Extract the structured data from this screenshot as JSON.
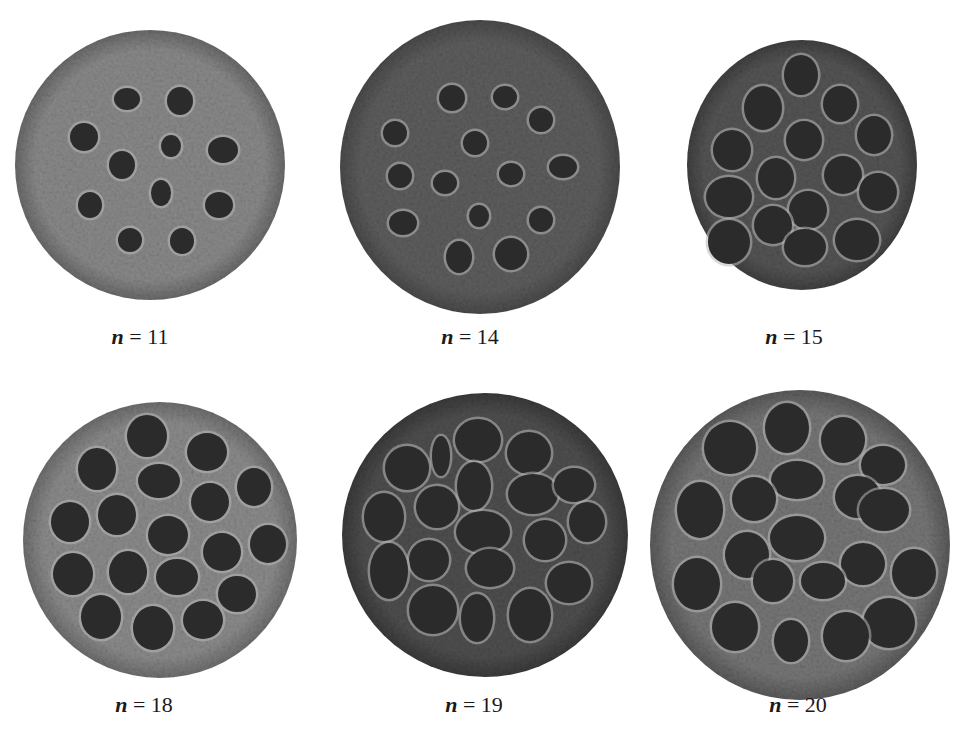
{
  "figure": {
    "panels": [
      {
        "id": "n11",
        "caption_var": "n",
        "caption_eq": " = ",
        "caption_value": "11",
        "pod": {
          "cx": 150,
          "cy": 165,
          "rx": 135,
          "ry": 135,
          "tone": "#8a8a8a",
          "rim": "#6a6a6a"
        },
        "holes": [
          [
            127,
            99,
            13,
            11
          ],
          [
            180,
            101,
            13,
            14
          ],
          [
            84,
            137,
            14,
            14
          ],
          [
            171,
            146,
            10,
            11
          ],
          [
            223,
            150,
            15,
            13
          ],
          [
            122,
            165,
            13,
            14
          ],
          [
            161,
            193,
            10,
            13
          ],
          [
            219,
            205,
            14,
            13
          ],
          [
            90,
            205,
            12,
            13
          ],
          [
            130,
            240,
            12,
            12
          ],
          [
            182,
            241,
            12,
            13
          ]
        ]
      },
      {
        "id": "n14",
        "caption_var": "n",
        "caption_eq": " = ",
        "caption_value": "14",
        "pod": {
          "cx": 480,
          "cy": 167,
          "rx": 140,
          "ry": 147,
          "tone": "#5e5e5e",
          "rim": "#4a4a4a"
        },
        "holes": [
          [
            452,
            98,
            13,
            13
          ],
          [
            505,
            97,
            12,
            11
          ],
          [
            541,
            120,
            12,
            12
          ],
          [
            395,
            133,
            12,
            12
          ],
          [
            475,
            143,
            12,
            12
          ],
          [
            400,
            176,
            12,
            12
          ],
          [
            445,
            183,
            12,
            11
          ],
          [
            511,
            174,
            12,
            11
          ],
          [
            563,
            167,
            14,
            11
          ],
          [
            403,
            223,
            14,
            12
          ],
          [
            479,
            216,
            10,
            11
          ],
          [
            541,
            220,
            12,
            12
          ],
          [
            459,
            257,
            13,
            16
          ],
          [
            511,
            254,
            16,
            16
          ]
        ]
      },
      {
        "id": "n15",
        "caption_var": "n",
        "caption_eq": " = ",
        "caption_value": "15",
        "pod": {
          "cx": 802,
          "cy": 165,
          "rx": 115,
          "ry": 125,
          "tone": "#555555",
          "rim": "#404040"
        },
        "holes": [
          [
            801,
            75,
            17,
            20
          ],
          [
            763,
            108,
            19,
            22
          ],
          [
            840,
            104,
            17,
            18
          ],
          [
            874,
            135,
            17,
            19
          ],
          [
            732,
            150,
            19,
            20
          ],
          [
            804,
            140,
            18,
            19
          ],
          [
            776,
            178,
            18,
            20
          ],
          [
            843,
            175,
            19,
            19
          ],
          [
            729,
            197,
            23,
            20
          ],
          [
            808,
            210,
            19,
            19
          ],
          [
            878,
            192,
            19,
            19
          ],
          [
            773,
            225,
            19,
            19
          ],
          [
            729,
            242,
            21,
            22
          ],
          [
            805,
            247,
            21,
            18
          ],
          [
            857,
            240,
            22,
            20
          ]
        ]
      },
      {
        "id": "n18",
        "caption_var": "n",
        "caption_eq": " = ",
        "caption_value": "18",
        "pod": {
          "cx": 160,
          "cy": 540,
          "rx": 137,
          "ry": 138,
          "tone": "#8c8c8c",
          "rim": "#6e6e6e"
        },
        "holes": [
          [
            147,
            436,
            20,
            21
          ],
          [
            207,
            452,
            20,
            19
          ],
          [
            97,
            469,
            19,
            21
          ],
          [
            159,
            481,
            21,
            17
          ],
          [
            254,
            487,
            17,
            19
          ],
          [
            210,
            502,
            19,
            19
          ],
          [
            70,
            522,
            19,
            20
          ],
          [
            117,
            515,
            19,
            20
          ],
          [
            168,
            535,
            20,
            19
          ],
          [
            222,
            552,
            19,
            19
          ],
          [
            268,
            544,
            18,
            19
          ],
          [
            73,
            574,
            20,
            21
          ],
          [
            128,
            572,
            19,
            21
          ],
          [
            177,
            577,
            21,
            18
          ],
          [
            237,
            594,
            19,
            18
          ],
          [
            101,
            617,
            20,
            22
          ],
          [
            153,
            628,
            20,
            22
          ],
          [
            203,
            620,
            20,
            19
          ]
        ]
      },
      {
        "id": "n19",
        "caption_var": "n",
        "caption_eq": " = ",
        "caption_value": "19",
        "pod": {
          "cx": 485,
          "cy": 535,
          "rx": 143,
          "ry": 142,
          "tone": "#4f4f4f",
          "rim": "#3a3a3a"
        },
        "holes": [
          [
            478,
            440,
            23,
            21
          ],
          [
            529,
            453,
            22,
            21
          ],
          [
            407,
            468,
            22,
            22
          ],
          [
            441,
            456,
            9,
            20
          ],
          [
            474,
            486,
            17,
            24
          ],
          [
            533,
            494,
            25,
            20
          ],
          [
            437,
            507,
            21,
            21
          ],
          [
            574,
            485,
            20,
            17
          ],
          [
            384,
            517,
            20,
            24
          ],
          [
            483,
            532,
            27,
            21
          ],
          [
            545,
            540,
            20,
            20
          ],
          [
            587,
            522,
            18,
            20
          ],
          [
            429,
            560,
            20,
            20
          ],
          [
            490,
            568,
            23,
            19
          ],
          [
            569,
            583,
            22,
            20
          ],
          [
            389,
            571,
            19,
            28
          ],
          [
            433,
            610,
            24,
            24
          ],
          [
            477,
            618,
            16,
            24
          ],
          [
            530,
            615,
            21,
            26
          ]
        ]
      },
      {
        "id": "n20",
        "caption_var": "n",
        "caption_eq": " = ",
        "caption_value": "20",
        "pod": {
          "cx": 800,
          "cy": 545,
          "rx": 150,
          "ry": 155,
          "tone": "#777777",
          "rim": "#5a5a5a"
        },
        "holes": [
          [
            787,
            428,
            22,
            25
          ],
          [
            730,
            448,
            26,
            26
          ],
          [
            843,
            440,
            22,
            23
          ],
          [
            883,
            465,
            22,
            19
          ],
          [
            797,
            480,
            26,
            19
          ],
          [
            754,
            499,
            22,
            22
          ],
          [
            700,
            510,
            23,
            28
          ],
          [
            858,
            497,
            23,
            21
          ],
          [
            884,
            510,
            25,
            21
          ],
          [
            797,
            538,
            27,
            22
          ],
          [
            747,
            555,
            22,
            23
          ],
          [
            863,
            564,
            22,
            21
          ],
          [
            914,
            573,
            22,
            24
          ],
          [
            697,
            584,
            23,
            26
          ],
          [
            773,
            581,
            20,
            21
          ],
          [
            823,
            581,
            22,
            18
          ],
          [
            735,
            627,
            23,
            24
          ],
          [
            889,
            623,
            26,
            25
          ],
          [
            791,
            641,
            17,
            21
          ],
          [
            846,
            636,
            23,
            24
          ]
        ]
      }
    ]
  }
}
